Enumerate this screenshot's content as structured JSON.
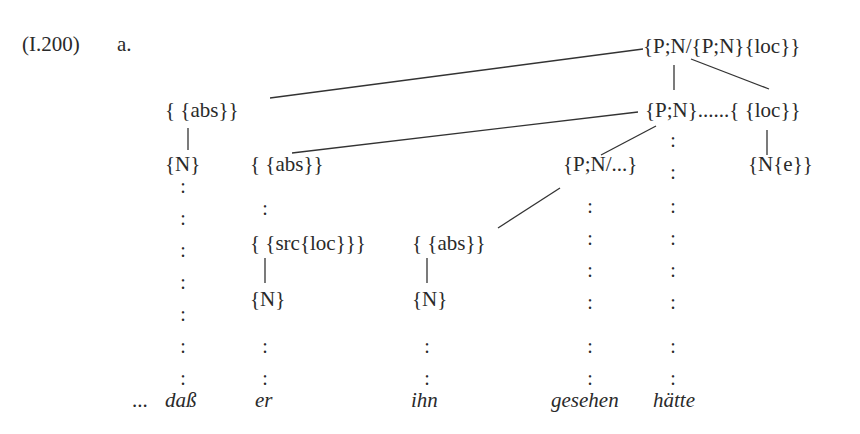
{
  "example": {
    "number": "(I.200)",
    "sub_label": "a."
  },
  "nodes": {
    "root": "{P;N/{P;N}{loc}}",
    "abs_top": "{ {abs}}",
    "pn": "{P;N}",
    "dots": "......",
    "loc": "{ {loc}}",
    "n_left": "{N}",
    "abs_mid": "{ {abs}}",
    "pn_slash": "{P;N/...}",
    "n_e": "{N{e}}",
    "src_loc": "{ {src{loc}}}",
    "abs_ihn": "{ {abs}}",
    "n_er": "{N}",
    "n_ihn": "{N}"
  },
  "words": {
    "ellipsis": "...",
    "w1": "daß",
    "w2": "er",
    "w3": "ihn",
    "w4": "gesehen",
    "w5": "hätte"
  },
  "colon_glyph": ":"
}
